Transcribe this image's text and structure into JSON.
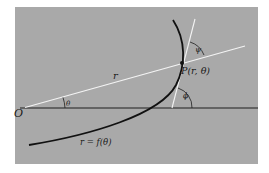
{
  "figure": {
    "colors": {
      "panel": "#a9a9a9",
      "curve": "#111111",
      "axis": "#1e1e1e",
      "radius_line": "#f4f4f4",
      "tangent_line": "#f4f4f4"
    },
    "labels": {
      "origin": "O",
      "radius": "r",
      "theta": "θ",
      "point": "P(r, θ)",
      "psi": "ψ",
      "phi": "ϕ",
      "curve": "r = f(θ)"
    }
  }
}
